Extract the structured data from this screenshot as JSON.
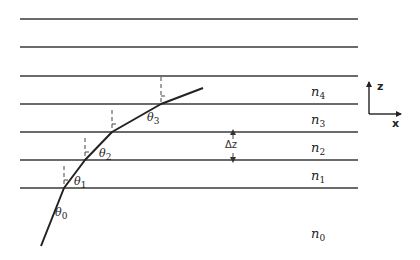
{
  "diagram": {
    "title": "",
    "layer_boundaries_y": [
      19,
      47,
      76,
      104,
      132,
      160,
      188
    ],
    "boundary_x_range": [
      20,
      358
    ],
    "line_color": "#3a3a3a",
    "ray": {
      "points": [
        [
          41,
          246
        ],
        [
          64,
          188
        ],
        [
          85,
          160
        ],
        [
          112,
          132
        ],
        [
          161,
          104
        ],
        [
          203,
          88
        ]
      ],
      "color": "#222222"
    },
    "normals": [
      {
        "x": 64,
        "y1": 166,
        "y2": 188
      },
      {
        "x": 85,
        "y1": 138,
        "y2": 160
      },
      {
        "x": 112,
        "y1": 110,
        "y2": 132
      },
      {
        "x": 161,
        "y1": 77,
        "y2": 104
      }
    ],
    "angle_labels": [
      {
        "base": "θ",
        "sub": "0",
        "x": 55,
        "y": 207
      },
      {
        "base": "θ",
        "sub": "1",
        "x": 74,
        "y": 176
      },
      {
        "base": "θ",
        "sub": "2",
        "x": 99,
        "y": 148
      },
      {
        "base": "θ",
        "sub": "3",
        "x": 147,
        "y": 112
      }
    ],
    "refractive_index_labels": [
      {
        "base": "n",
        "sub": "4",
        "x": 311,
        "y": 85
      },
      {
        "base": "n",
        "sub": "3",
        "x": 311,
        "y": 113
      },
      {
        "base": "n",
        "sub": "2",
        "x": 311,
        "y": 141
      },
      {
        "base": "n",
        "sub": "1",
        "x": 311,
        "y": 169
      },
      {
        "base": "n",
        "sub": "0",
        "x": 311,
        "y": 227
      }
    ],
    "delta_z": {
      "label": "Δz",
      "x": 233,
      "y_top": 132,
      "y_bottom": 160
    },
    "axes": {
      "origin": [
        369,
        114
      ],
      "z_end": [
        369,
        82
      ],
      "x_end": [
        401,
        114
      ],
      "z_label": "z",
      "x_label": "x"
    }
  }
}
